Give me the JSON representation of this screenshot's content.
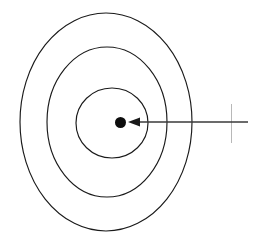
{
  "figure": {
    "background_color": "#ffffff",
    "width": 256,
    "height": 245,
    "stroke_color": "#1a1a1a",
    "dot_color": "#0d0d0d",
    "arrow_color": "#3a3a3a"
  },
  "chart_data": {
    "type": "scatter",
    "title": "",
    "subtitle": "",
    "xlabel": "",
    "ylabel": "",
    "grid": false,
    "legend": null,
    "annotations": [],
    "rings": [
      {
        "name": "outer-ring",
        "cx": 106,
        "cy": 122,
        "rx": 86,
        "ry": 109
      },
      {
        "name": "middle-ring",
        "cx": 107,
        "cy": 122,
        "rx": 60,
        "ry": 75
      },
      {
        "name": "inner-ring",
        "cx": 112,
        "cy": 123,
        "rx": 36,
        "ry": 35
      }
    ],
    "points": [
      {
        "name": "center-dot",
        "cx": 120.5,
        "cy": 122.5,
        "r": 5.5
      }
    ],
    "arrows": [
      {
        "name": "pointer-arrow",
        "from_x": 248,
        "from_y": 122,
        "to_x": 128,
        "to_y": 122,
        "head_length": 12,
        "head_width": 9
      }
    ]
  }
}
